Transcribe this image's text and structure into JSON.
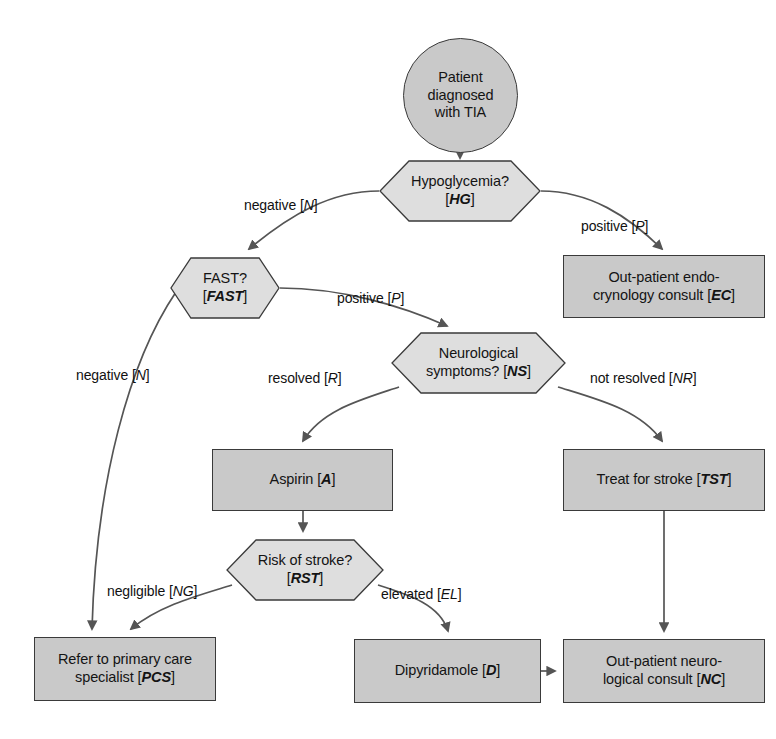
{
  "diagram": {
    "colors": {
      "rect_fill": "#c9c9c9",
      "hex_fill": "#dedede",
      "stroke": "#3a3a3a",
      "edge": "#555555",
      "text": "#141414",
      "background": "#ffffff"
    },
    "nodes": [
      {
        "id": "start",
        "name": "patient-diagnosed-with-tia",
        "shape": "circle",
        "text": "Patient\ndiagnosed\nwith TIA",
        "code": "",
        "x": 403,
        "y": 38,
        "w": 115,
        "h": 115
      },
      {
        "id": "hg",
        "name": "hypoglycemia-decision",
        "shape": "hexagon",
        "text": "Hypoglycemia?",
        "code": "HG",
        "x": 379,
        "y": 160,
        "w": 162,
        "h": 62
      },
      {
        "id": "ec",
        "name": "out-patient-endocrynology-consult",
        "shape": "rect",
        "text": "Out-patient endo-\ncrynology consult",
        "code": "EC",
        "x": 563,
        "y": 255,
        "w": 202,
        "h": 63
      },
      {
        "id": "fast",
        "name": "fast-decision",
        "shape": "hexagon",
        "text": "FAST?",
        "code": "FAST",
        "x": 170,
        "y": 257,
        "w": 110,
        "h": 62
      },
      {
        "id": "ns",
        "name": "neurological-symptoms-decision",
        "shape": "hexagon",
        "text": "Neurological\nsymptoms?",
        "code": "NS",
        "x": 391,
        "y": 332,
        "w": 175,
        "h": 62
      },
      {
        "id": "aspirin",
        "name": "aspirin-treatment",
        "shape": "rect",
        "text": "Aspirin",
        "code": "A",
        "x": 212,
        "y": 449,
        "w": 181,
        "h": 62
      },
      {
        "id": "tst",
        "name": "treat-for-stroke",
        "shape": "rect",
        "text": "Treat for stroke",
        "code": "TST",
        "x": 563,
        "y": 449,
        "w": 202,
        "h": 62
      },
      {
        "id": "rst",
        "name": "risk-of-stroke-decision",
        "shape": "hexagon",
        "text": "Risk of stroke?",
        "code": "RST",
        "x": 226,
        "y": 539,
        "w": 158,
        "h": 62
      },
      {
        "id": "pcs",
        "name": "refer-to-primary-care-specialist",
        "shape": "rect",
        "text": "Refer to primary care\nspecialist",
        "code": "PCS",
        "x": 34,
        "y": 637,
        "w": 182,
        "h": 64
      },
      {
        "id": "dipyridamole",
        "name": "dipyridamole-treatment",
        "shape": "rect",
        "text": "Dipyridamole",
        "code": "D",
        "x": 354,
        "y": 639,
        "w": 187,
        "h": 64
      },
      {
        "id": "nc",
        "name": "out-patient-neurological-consult",
        "shape": "rect",
        "text": "Out-patient neuro-\nlogical consult",
        "code": "NC",
        "x": 563,
        "y": 639,
        "w": 202,
        "h": 64
      }
    ],
    "edges": [
      {
        "name": "edge-start-to-hypoglycemia",
        "from": "start",
        "to": "hg",
        "label": "",
        "code": "",
        "path": "M 460,153 L 460,158"
      },
      {
        "name": "edge-hypoglycemia-negative-to-fast",
        "from": "hg",
        "to": "fast",
        "label": "negative",
        "code": "N",
        "label_x": 244,
        "label_y": 197,
        "path": "M 379,191 C 330,191 290,215 249,249"
      },
      {
        "name": "edge-hypoglycemia-positive-to-endo",
        "from": "hg",
        "to": "ec",
        "label": "positive",
        "code": "P",
        "label_x": 581,
        "label_y": 218,
        "path": "M 541,191 C 590,191 628,216 662,249"
      },
      {
        "name": "edge-fast-positive-to-neuro",
        "from": "fast",
        "to": "ns",
        "label": "positive",
        "code": "P",
        "label_x": 337,
        "label_y": 290,
        "path": "M 280,288 C 340,288 400,305 447,326"
      },
      {
        "name": "edge-fast-negative-to-pcs",
        "from": "fast",
        "to": "pcs",
        "label": "negative",
        "code": "N",
        "label_x": 76,
        "label_y": 367,
        "path": "M 176,292 C 130,360 96,480 92,629"
      },
      {
        "name": "edge-neuro-resolved-to-aspirin",
        "from": "ns",
        "to": "aspirin",
        "label": "resolved",
        "code": "R",
        "label_x": 268,
        "label_y": 370,
        "path": "M 399,387 C 360,400 322,410 303,441"
      },
      {
        "name": "edge-neuro-not-resolved-to-stroke",
        "from": "ns",
        "to": "tst",
        "label": "not resolved",
        "code": "NR",
        "label_x": 590,
        "label_y": 370,
        "path": "M 558,387 C 600,400 640,410 662,441"
      },
      {
        "name": "edge-aspirin-to-risk",
        "from": "aspirin",
        "to": "rst",
        "label": "",
        "code": "",
        "path": "M 303,511 L 303,531"
      },
      {
        "name": "edge-risk-negligible-to-pcs",
        "from": "rst",
        "to": "pcs",
        "label": "negligible",
        "code": "NG",
        "label_x": 107,
        "label_y": 583,
        "path": "M 232,585 C 200,595 160,605 131,629"
      },
      {
        "name": "edge-risk-elevated-to-dipyridamole",
        "from": "rst",
        "to": "dipyridamole",
        "label": "elevated",
        "code": "EL",
        "label_x": 381,
        "label_y": 586,
        "path": "M 378,585 C 410,595 440,605 448,631"
      },
      {
        "name": "edge-stroke-to-neuro-consult",
        "from": "tst",
        "to": "nc",
        "label": "",
        "code": "",
        "path": "M 664,511 L 664,631"
      },
      {
        "name": "edge-dipyridamole-to-neuro-consult",
        "from": "dipyridamole",
        "to": "nc",
        "label": "",
        "code": "",
        "path": "M 541,671 L 555,671"
      }
    ]
  }
}
